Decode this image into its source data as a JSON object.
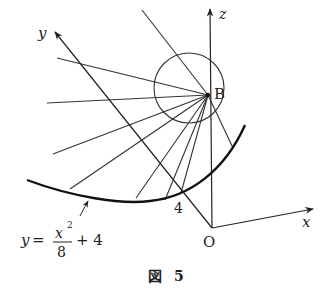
{
  "figure": {
    "caption_prefix": "図",
    "caption_number": "5",
    "colors": {
      "ink": "#222222",
      "background": "#ffffff"
    }
  },
  "axes": {
    "x_label": "x",
    "y_label": "y",
    "z_label": "z",
    "origin_label": "O"
  },
  "points": {
    "B_label": "B",
    "tick_4_label": "4"
  },
  "curve": {
    "equation_lhs": "y",
    "equation_eq": "=",
    "equation_numerator": "x",
    "equation_exponent": "2",
    "equation_denominator": "8",
    "equation_tail": "+ 4"
  }
}
